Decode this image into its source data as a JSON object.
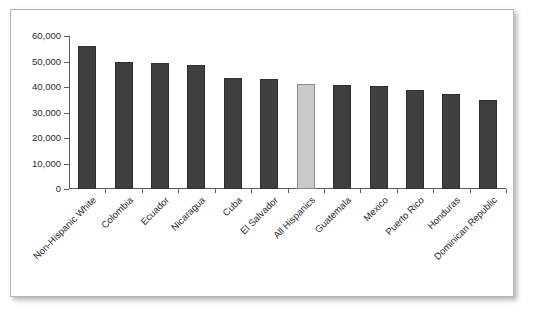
{
  "chart_data": {
    "type": "bar",
    "title": "",
    "subtitle": "",
    "xlabel": "",
    "ylabel": "",
    "ylim": [
      0,
      60000
    ],
    "ytick_values": [
      0,
      10000,
      20000,
      30000,
      40000,
      50000,
      60000
    ],
    "ytick_labels": [
      "0",
      "10,000",
      "20,000",
      "30,000",
      "40,000",
      "50,000",
      "60,000"
    ],
    "grid": false,
    "legend": false,
    "legend_position": "none",
    "xtick_rotation": -45,
    "categories": [
      "Non-Hispanic White",
      "Colombia",
      "Ecuador",
      "Nicaragua",
      "Cuba",
      "El Salvador",
      "All Hispanics",
      "Guatemala",
      "Mexico",
      "Puerto Rico",
      "Honduras",
      "Dominican Republic"
    ],
    "values": [
      56000,
      49900,
      49500,
      48600,
      43400,
      43300,
      41300,
      40900,
      40400,
      38700,
      37400,
      35100
    ],
    "highlighted_category": "All Hispanics",
    "bar_color": "#3f3f3f",
    "highlight_color": "#c9c9c9",
    "bar_border_color": "#2e2e2e",
    "highlight_border_color": "#8d8d8d",
    "axis_color": "#5d5d5d",
    "background_color": "#ffffff",
    "border_color": "#b4b4b4"
  }
}
